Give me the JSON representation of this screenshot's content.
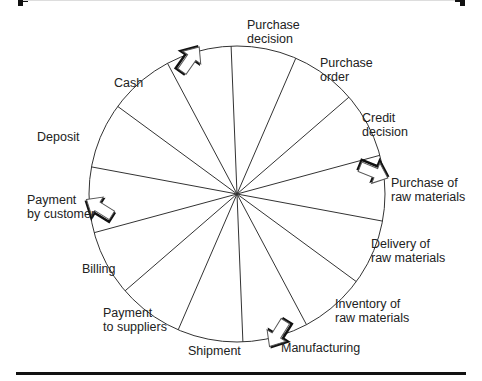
{
  "diagram": {
    "type": "cycle",
    "center": [
      237,
      194
    ],
    "radius": 148,
    "spoke_start_angle_deg": -92.3,
    "segment_count": 14,
    "colors": {
      "line": "#333333",
      "frame": "#111111",
      "arrow": "#111111",
      "text": "#222222"
    },
    "stages": [
      {
        "id": "purchase-decision",
        "lines": [
          "Purchase",
          "decision"
        ],
        "x": 247,
        "y": 18
      },
      {
        "id": "purchase-order",
        "lines": [
          "Purchase",
          "order"
        ],
        "x": 320,
        "y": 56
      },
      {
        "id": "credit-decision",
        "lines": [
          "Credit",
          "decision"
        ],
        "x": 362,
        "y": 111
      },
      {
        "id": "purchase-of-raw-materials",
        "lines": [
          "Purchase of",
          "raw materials"
        ],
        "x": 391,
        "y": 176
      },
      {
        "id": "delivery-of-raw-materials",
        "lines": [
          "Delivery of",
          "raw materials"
        ],
        "x": 371,
        "y": 237
      },
      {
        "id": "inventory-of-raw-materials",
        "lines": [
          "Inventory of",
          "raw materials"
        ],
        "x": 335,
        "y": 297
      },
      {
        "id": "manufacturing",
        "lines": [
          "Manufacturing"
        ],
        "x": 281,
        "y": 341
      },
      {
        "id": "shipment",
        "lines": [
          "Shipment"
        ],
        "x": 188,
        "y": 344
      },
      {
        "id": "payment-to-suppliers",
        "lines": [
          "Payment",
          "to suppliers"
        ],
        "x": 103,
        "y": 306
      },
      {
        "id": "billing",
        "lines": [
          "Billing"
        ],
        "x": 82,
        "y": 262
      },
      {
        "id": "payment-by-customer",
        "lines": [
          "Payment",
          "by customer"
        ],
        "x": 27,
        "y": 193
      },
      {
        "id": "deposit",
        "lines": [
          "Deposit"
        ],
        "x": 37,
        "y": 130
      },
      {
        "id": "cash",
        "lines": [
          "Cash"
        ],
        "x": 114,
        "y": 76
      }
    ],
    "arrows": [
      {
        "id": "arrow-top",
        "at": [
          190,
          60
        ],
        "rotate": 35
      },
      {
        "id": "arrow-right",
        "at": [
          373,
          172
        ],
        "rotate": 112
      },
      {
        "id": "arrow-bottom",
        "at": [
          278,
          333
        ],
        "rotate": 212
      },
      {
        "id": "arrow-left",
        "at": [
          100,
          208
        ],
        "rotate": -58
      }
    ]
  }
}
